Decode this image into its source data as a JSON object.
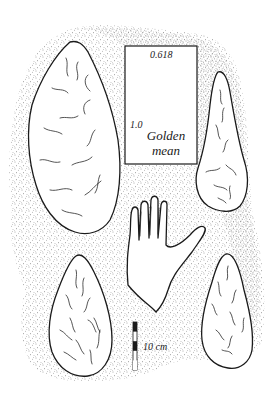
{
  "figure": {
    "golden_rectangle": {
      "short_side_label": "0.618",
      "long_side_label": "1.0",
      "title_line1": "Golden",
      "title_line2": "mean"
    },
    "scale_bar": {
      "label": "10 cm",
      "segments": 5
    },
    "objects": [
      {
        "name": "handaxe-top-left"
      },
      {
        "name": "handaxe-top-right"
      },
      {
        "name": "handaxe-bottom-left"
      },
      {
        "name": "handaxe-bottom-right"
      },
      {
        "name": "human-hand"
      }
    ],
    "colors": {
      "ink": "#1a1a1a",
      "paper": "#ffffff",
      "stipple": "#555555"
    }
  }
}
